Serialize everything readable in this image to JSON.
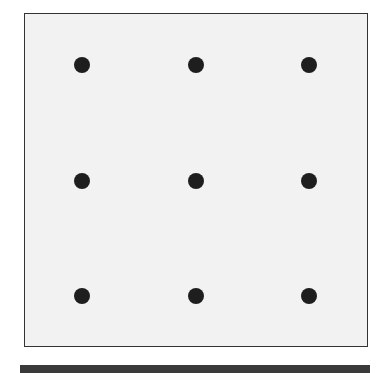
{
  "diagram": {
    "type": "dot-grid",
    "rows": 3,
    "cols": 3,
    "board_color": "#f2f2f2",
    "border_color": "#333333",
    "dot_color": "#1e1e1e",
    "bar_color": "#3a3a3a",
    "dots": [
      {
        "row": 1,
        "col": 1,
        "x": 82,
        "y": 65
      },
      {
        "row": 1,
        "col": 2,
        "x": 196,
        "y": 65
      },
      {
        "row": 1,
        "col": 3,
        "x": 309,
        "y": 65
      },
      {
        "row": 2,
        "col": 1,
        "x": 82,
        "y": 181
      },
      {
        "row": 2,
        "col": 2,
        "x": 196,
        "y": 181
      },
      {
        "row": 2,
        "col": 3,
        "x": 309,
        "y": 181
      },
      {
        "row": 3,
        "col": 1,
        "x": 82,
        "y": 296
      },
      {
        "row": 3,
        "col": 2,
        "x": 196,
        "y": 296
      },
      {
        "row": 3,
        "col": 3,
        "x": 309,
        "y": 296
      }
    ]
  }
}
